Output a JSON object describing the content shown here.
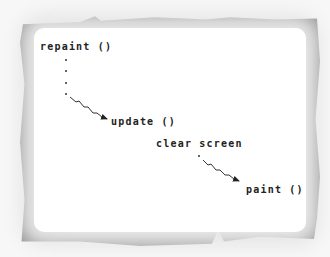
{
  "diagram": {
    "nodes": [
      {
        "id": "repaint",
        "label": "repaint ()"
      },
      {
        "id": "update",
        "label": "update ()"
      },
      {
        "id": "clear",
        "label": "clear screen"
      },
      {
        "id": "paint",
        "label": "paint ()"
      }
    ],
    "edges": [
      {
        "from": "repaint",
        "to": "update",
        "style": "dotted-then-wavy-arrow"
      },
      {
        "from": "clear",
        "to": "paint",
        "style": "dot-then-wavy-arrow"
      }
    ],
    "colors": {
      "frame": "#8f8f8f",
      "background": "#ffffff",
      "text": "#222222"
    }
  }
}
